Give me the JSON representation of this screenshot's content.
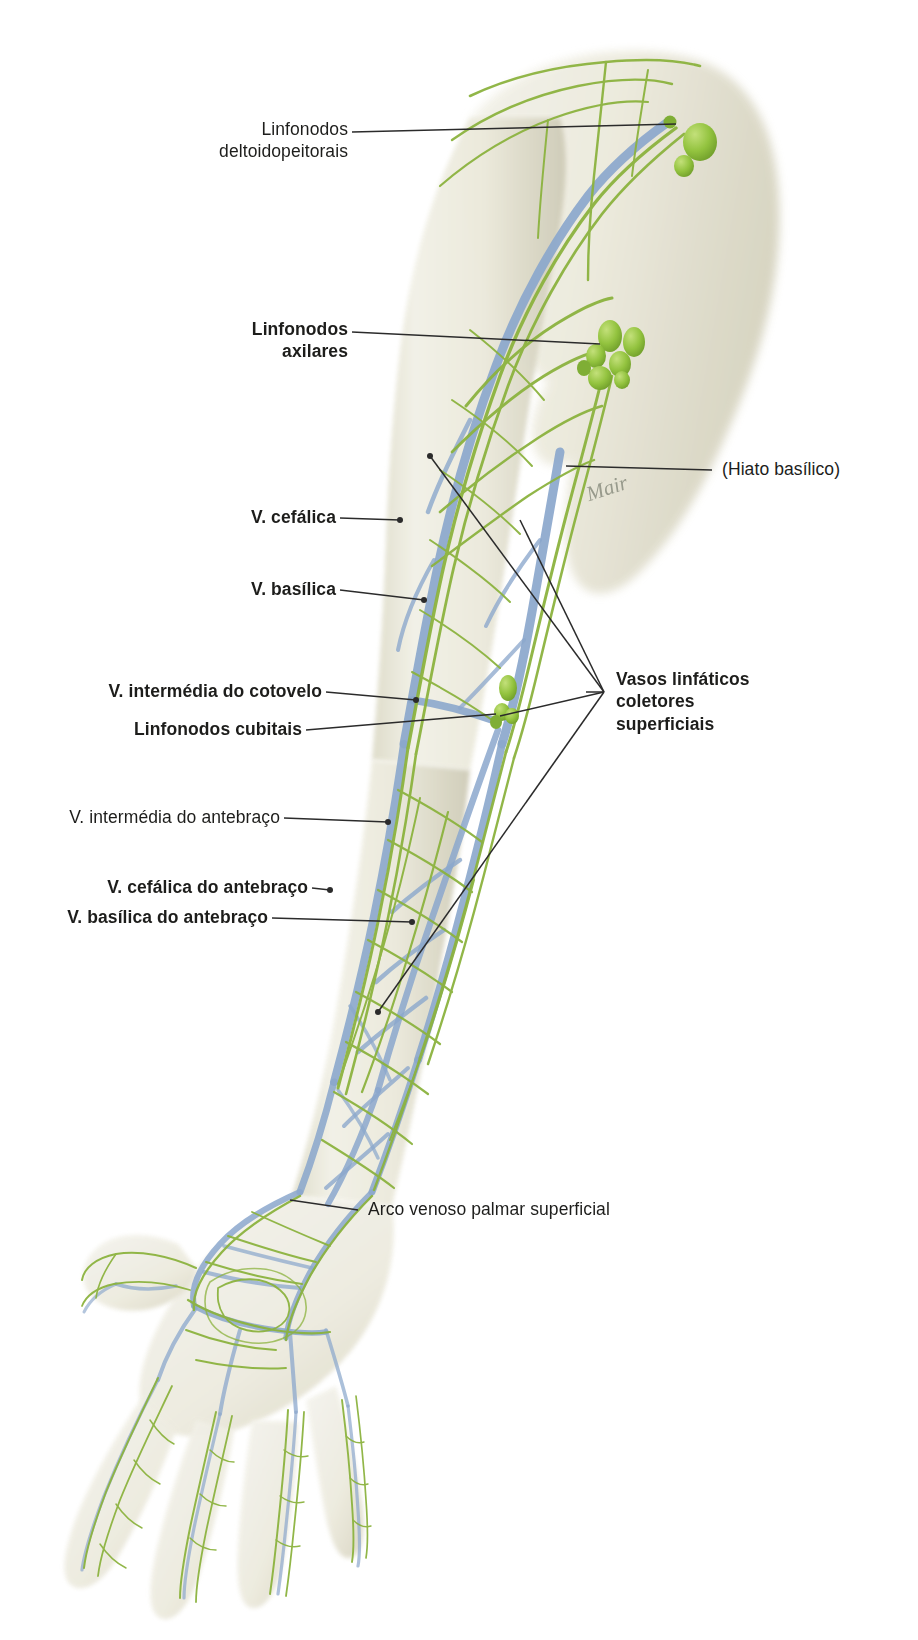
{
  "figure": {
    "artist_signature": "Mair",
    "colors": {
      "lymphatic_vessel": "#8cb33f",
      "lymph_node": "#8cc63f",
      "vein": "#8ba7cc",
      "skin_light": "#efeee2",
      "skin_shadow": "#d9d7c4",
      "leader_line": "#2b2b2b",
      "text": "#1d1d1b",
      "background": "#ffffff"
    }
  },
  "labels": [
    {
      "id": "linfonodos-deltoidopeitorais",
      "text": "Linfonodos\ndeltoidopeitorais",
      "bold": false,
      "align": "right",
      "side": "left"
    },
    {
      "id": "linfonodos-axilares",
      "text": "Linfonodos\naxilares",
      "bold": true,
      "align": "right",
      "side": "left"
    },
    {
      "id": "hiato-basilico",
      "text": "(Hiato basílico)",
      "bold": false,
      "align": "left",
      "side": "right"
    },
    {
      "id": "v-cefalica",
      "text": "V. cefálica",
      "bold": true,
      "align": "right",
      "side": "left"
    },
    {
      "id": "v-basilica",
      "text": "V. basílica",
      "bold": true,
      "align": "right",
      "side": "left"
    },
    {
      "id": "v-intermedia-do-cotovelo",
      "text": "V. intermédia do cotovelo",
      "bold": true,
      "align": "right",
      "side": "left"
    },
    {
      "id": "linfonodos-cubitais",
      "text": "Linfonodos cubitais",
      "bold": true,
      "align": "right",
      "side": "left"
    },
    {
      "id": "vasos-linfaticos-coletores-superficiais",
      "text": "Vasos linfáticos\ncoletores\nsuperficiais",
      "bold": true,
      "align": "left",
      "side": "right"
    },
    {
      "id": "v-intermedia-do-antebraco",
      "text": "V. intermédia do antebraço",
      "bold": false,
      "align": "right",
      "side": "left"
    },
    {
      "id": "v-cefalica-do-antebraco",
      "text": "V. cefálica do antebraço",
      "bold": true,
      "align": "right",
      "side": "left"
    },
    {
      "id": "v-basilica-do-antebraco",
      "text": "V. basílica do antebraço",
      "bold": true,
      "align": "right",
      "side": "left"
    },
    {
      "id": "arco-venoso-palmar-superficial",
      "text": "Arco venoso palmar superficial",
      "bold": false,
      "align": "left",
      "side": "bottom"
    }
  ],
  "structures": [
    {
      "id": "deltopectoral-nodes",
      "name": "Linfonodos deltoidopeitorais",
      "kind": "lymph-node-cluster"
    },
    {
      "id": "axillary-nodes",
      "name": "Linfonodos axilares",
      "kind": "lymph-node-cluster"
    },
    {
      "id": "cubital-nodes",
      "name": "Linfonodos cubitais",
      "kind": "lymph-node-cluster"
    },
    {
      "id": "cephalic-vein",
      "name": "V. cefálica",
      "kind": "vein"
    },
    {
      "id": "basilic-vein",
      "name": "V. basílica",
      "kind": "vein"
    },
    {
      "id": "median-cubital-vein",
      "name": "V. intermédia do cotovelo",
      "kind": "vein"
    },
    {
      "id": "median-antebrachial-vein",
      "name": "V. intermédia do antebraço",
      "kind": "vein"
    },
    {
      "id": "accessory-cephalic-vein",
      "name": "V. cefálica do antebraço",
      "kind": "vein"
    },
    {
      "id": "basilic-forearm-vein",
      "name": "V. basílica do antebraço",
      "kind": "vein"
    },
    {
      "id": "superficial-palmar-venous-arch",
      "name": "Arco venoso palmar superficial",
      "kind": "vein"
    },
    {
      "id": "basilic-hiatus",
      "name": "(Hiato basílico)",
      "kind": "anatomical-opening"
    },
    {
      "id": "superficial-collecting-lymphatics",
      "name": "Vasos linfáticos coletores superficiais",
      "kind": "lymphatic-vessel"
    }
  ]
}
